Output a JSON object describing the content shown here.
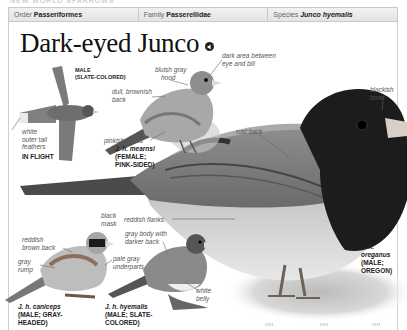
{
  "running_head": "New World Sparrows",
  "taxonomy": {
    "order_label": "Order",
    "order_value": "Passeriformes",
    "family_label": "Family",
    "family_value": "Passerellidae",
    "species_label": "Species",
    "species_value": "Junco hyemalis"
  },
  "title": "Dark-eyed Junco",
  "audio_icon": "speaker-icon",
  "flight": {
    "label_male": "MALE",
    "label_form": "(SLATE-COLORED)",
    "tail_label_1": "white",
    "tail_label_2": "outer tail",
    "tail_label_3": "feathers",
    "caption": "IN FLIGHT"
  },
  "mearnsi": {
    "hood_1": "bluish gray",
    "hood_2": "hood",
    "back_1": "dull, brownish",
    "back_2": "back",
    "flanks": "pinkish flanks",
    "caption_name": "J. h. mearnsi",
    "caption_2": "(FEMALE;",
    "caption_3": "PINK-SIDED)"
  },
  "oreganus": {
    "dark_area_1": "dark area between",
    "dark_area_2": "eye and bill",
    "hood_1": "blackish",
    "hood_2": "hood",
    "back": "rust back",
    "flanks": "reddish flanks",
    "caption_1": "J. h.",
    "caption_name": "oreganus",
    "caption_3": "(MALE;",
    "caption_4": "OREGON)"
  },
  "caniceps": {
    "mask_1": "black",
    "mask_2": "mask",
    "back_1": "reddish",
    "back_2": "brown back",
    "rump_1": "gray",
    "rump_2": "rump",
    "underparts_1": "pale gray",
    "underparts_2": "underparts",
    "caption_name": "J. h. caniceps",
    "caption_2": "(MALE; GRAY-",
    "caption_3": "HEADED)"
  },
  "hyemalis": {
    "body_1": "gray body with",
    "body_2": "darker back",
    "belly_1": "white",
    "belly_2": "belly",
    "caption_name": "J. h. hyemalis",
    "caption_2": "(MALE; SLATE-",
    "caption_3": "COLORED)"
  },
  "bottom_ticks": [
    "ıııı",
    "ıııı",
    "ıııı"
  ]
}
